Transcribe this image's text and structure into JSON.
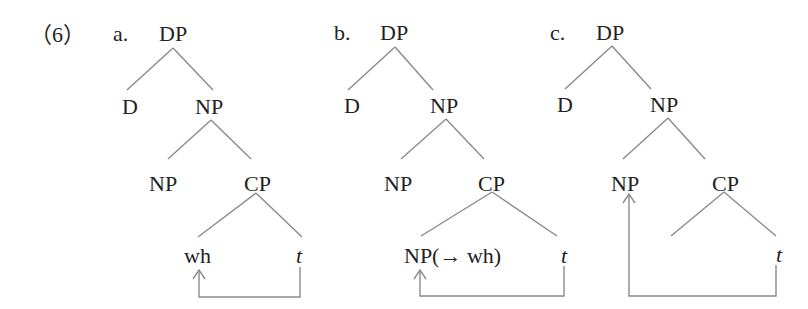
{
  "example_number": "（6）",
  "trees": [
    {
      "label": "a.",
      "root": "DP",
      "d": "D",
      "np": "NP",
      "np_inner": "NP",
      "cp": "CP",
      "cp_left": "wh",
      "cp_right": "t",
      "movement": "t → wh"
    },
    {
      "label": "b.",
      "root": "DP",
      "d": "D",
      "np": "NP",
      "np_inner": "NP",
      "cp": "CP",
      "cp_left": "NP(→ wh)",
      "cp_right": "t",
      "movement": "t → NP(→ wh)"
    },
    {
      "label": "c.",
      "root": "DP",
      "d": "D",
      "np": "NP",
      "np_inner": "NP",
      "cp": "CP",
      "cp_left": "",
      "cp_right": "t",
      "movement": "t → NP"
    }
  ],
  "colors": {
    "line": "#888888",
    "text": "#222222"
  }
}
